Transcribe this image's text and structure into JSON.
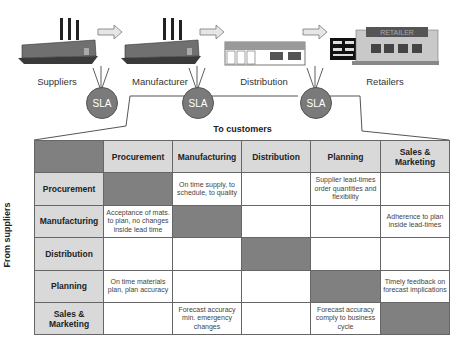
{
  "stages": [
    {
      "label": "Suppliers",
      "icon": "factory-icon"
    },
    {
      "label": "Manufacturer",
      "icon": "factory-icon"
    },
    {
      "label": "Distribution",
      "icon": "warehouse-icon"
    },
    {
      "label": "Retailers",
      "icon": "store-icon"
    }
  ],
  "sla_label": "SLA",
  "retailer_sign": "RETAILER",
  "axis": {
    "top": "To customers",
    "left": "From suppliers"
  },
  "matrix": {
    "columns": [
      "Procurement",
      "Manufacturing",
      "Distribution",
      "Planning",
      "Sales & Marketing"
    ],
    "rows": [
      {
        "label": "Procurement",
        "cells": [
          "",
          "On time supply, to schedule, to quality",
          "",
          "Supplier lead-times order quantities and flexibility",
          ""
        ]
      },
      {
        "label": "Manufacturing",
        "cells": [
          "Acceptance of mats. to plan, no changes inside lead time",
          "",
          "",
          "",
          "Adherence to plan inside lead-times"
        ]
      },
      {
        "label": "Distribution",
        "cells": [
          "",
          "",
          "",
          "",
          ""
        ]
      },
      {
        "label": "Planning",
        "cells": [
          "On time materials plan, plan accuracy",
          "",
          "",
          "",
          "Timely feedback on forecast implications"
        ]
      },
      {
        "label": "Sales & Marketing",
        "cells": [
          "",
          "Forecast accuracy min. emergency changes",
          "",
          "Forecast accuracy comply to business cycle",
          ""
        ]
      }
    ]
  },
  "colors": {
    "header_fill": "#d9d9d9",
    "diagonal_fill": "#808080",
    "sla_fill": "#7a7a7a"
  }
}
